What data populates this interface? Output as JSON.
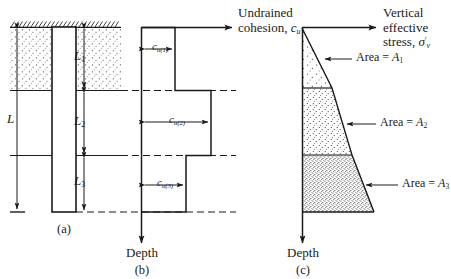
{
  "figure": {
    "panels": [
      {
        "id": "a",
        "caption": "(a)",
        "description": "pile-in-layered-soil-section"
      },
      {
        "id": "b",
        "caption": "(b)",
        "description": "undrained-cohesion-versus-depth"
      },
      {
        "id": "c",
        "caption": "(c)",
        "description": "vertical-effective-stress-versus-depth"
      }
    ]
  },
  "panel_a": {
    "caption": "(a)",
    "total_length_label": "L",
    "layer_labels": [
      "L",
      "L",
      "L"
    ],
    "layer_subscripts": [
      "1",
      "2",
      "3"
    ],
    "layers": [
      {
        "name": "layer-1",
        "label_base": "L",
        "label_sub": "1"
      },
      {
        "name": "layer-2",
        "label_base": "L",
        "label_sub": "2"
      },
      {
        "name": "layer-3",
        "label_base": "L",
        "label_sub": "3"
      }
    ]
  },
  "panel_b": {
    "caption": "(b)",
    "axis_x_title_line1": "Undrained",
    "axis_x_title_line2": "cohesion,",
    "axis_x_symbol": "c",
    "axis_x_symbol_sub": "u",
    "axis_y_title": "Depth",
    "bars": [
      {
        "name": "cu1",
        "base": "c",
        "sub": "u(1)"
      },
      {
        "name": "cu2",
        "base": "c",
        "sub": "u(2)"
      },
      {
        "name": "cu3",
        "base": "c",
        "sub": "u(3)"
      }
    ]
  },
  "panel_c": {
    "caption": "(c)",
    "axis_x_title_line1": "Vertical",
    "axis_x_title_line2": "effective",
    "axis_x_title_line3": "stress,",
    "axis_x_symbol": "σ",
    "axis_x_symbol_sub": "v",
    "axis_x_symbol_prime": "′",
    "axis_y_title": "Depth",
    "areas": [
      {
        "name": "area-1",
        "text": "Area = ",
        "base": "A",
        "sub": "1"
      },
      {
        "name": "area-2",
        "text": "Area = ",
        "base": "A",
        "sub": "2"
      },
      {
        "name": "area-3",
        "text": "Area = ",
        "base": "A",
        "sub": "3"
      }
    ]
  },
  "colors": {
    "ink": "#1a1a1a",
    "stipple": "#4a4a4a",
    "background": "#ffffff"
  }
}
